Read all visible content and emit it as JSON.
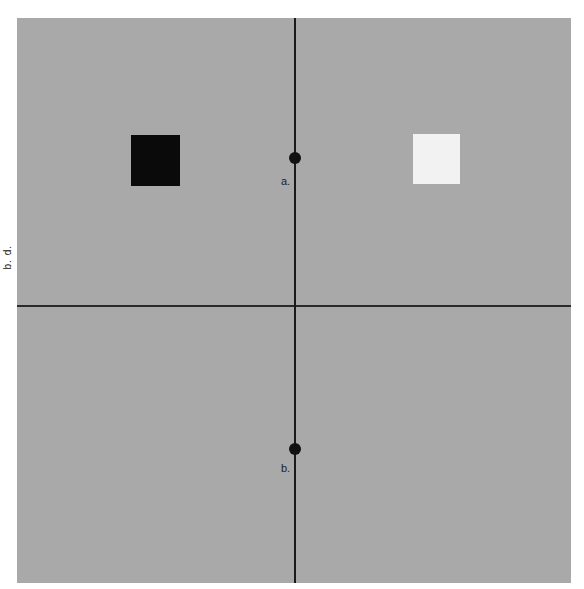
{
  "figure": {
    "side_label": "b. d.",
    "points": [
      {
        "id": "a",
        "label": "a."
      },
      {
        "id": "b",
        "label": "b."
      }
    ],
    "squares": [
      {
        "id": "left",
        "color": "#0a0a0a"
      },
      {
        "id": "right",
        "color": "#f2f2f2"
      }
    ],
    "background": "#a9a9a9"
  }
}
